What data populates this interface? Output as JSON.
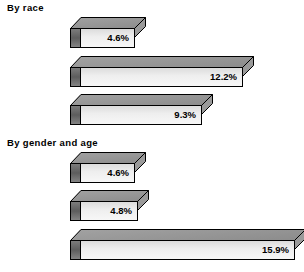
{
  "chart_data": {
    "type": "bar",
    "orientation": "horizontal",
    "title": "",
    "xlabel": "",
    "ylabel": "",
    "grid": false,
    "legend": null,
    "axis_visible": false,
    "value_suffix": "%",
    "xlim": [
      0,
      15.9
    ],
    "groups": [
      {
        "title": "By race",
        "categories": [
          "White",
          "Black",
          "Hispanic"
        ],
        "values": [
          4.6,
          12.2,
          9.3
        ],
        "value_labels": [
          "4.6%",
          "12.2%",
          "9.3%"
        ]
      },
      {
        "title": "By gender and age",
        "categories": [
          "Adult men",
          "Adult women",
          "Teenagers"
        ],
        "values": [
          4.6,
          4.8,
          15.9
        ],
        "value_labels": [
          "4.6%",
          "4.8%",
          "15.9%"
        ]
      }
    ]
  },
  "groups": [
    {
      "title": "By race",
      "bars": [
        {
          "label": "White",
          "value_label": "4.6%",
          "value": 4.6
        },
        {
          "label": "Black",
          "value_label": "12.2%",
          "value": 12.2
        },
        {
          "label": "Hispanic",
          "value_label": "9.3%",
          "value": 9.3
        }
      ]
    },
    {
      "title": "By gender and age",
      "bars": [
        {
          "label": "Adult men",
          "value_label": "4.6%",
          "value": 4.6
        },
        {
          "label": "Adult women",
          "value_label": "4.8%",
          "value": 4.8
        },
        {
          "label": "Teenagers",
          "value_label": "15.9%",
          "value": 15.9
        }
      ]
    }
  ],
  "colors": {
    "background": "#ffffff",
    "outline": "#000000",
    "bar_front_light": "#f7f7f7",
    "bar_front_dark": "#dcdcdc",
    "bar_top": "#949494",
    "bar_left_cap": "#5a5a5a",
    "text": "#000000"
  }
}
